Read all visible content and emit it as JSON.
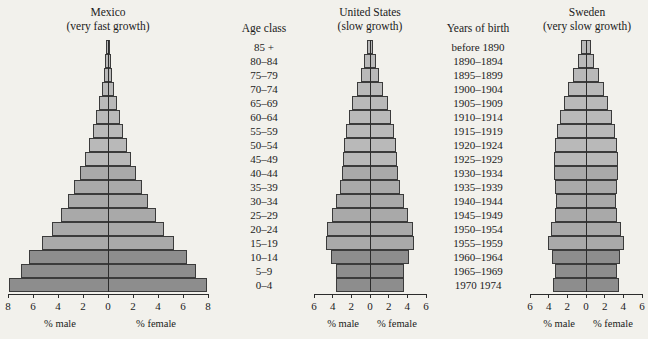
{
  "figure": {
    "background": "#f2f1ec",
    "band_colors": {
      "light": "#b9b9b9",
      "mid": "#a9a9a9",
      "dark": "#8d8d8d"
    },
    "axis_color": "#2c2c2c"
  },
  "columns": {
    "age_class": {
      "header": "Age class",
      "items": [
        "85 +",
        "80–84",
        "75–79",
        "70–74",
        "65–69",
        "60–64",
        "55–59",
        "50–54",
        "45–49",
        "40–44",
        "35–39",
        "30–34",
        "25–29",
        "20–24",
        "15–19",
        "10–14",
        "5–9",
        "0–4"
      ]
    },
    "years_of_birth": {
      "header": "Years of birth",
      "items": [
        "before 1890",
        "1890–1894",
        "1895–1899",
        "1900–1904",
        "1905–1909",
        "1910–1914",
        "1915–1919",
        "1920–1924",
        "1925–1929",
        "1930–1934",
        "1935–1939",
        "1940–1944",
        "1945–1949",
        "1950–1954",
        "1955–1959",
        "1960–1964",
        "1965–1969",
        "1970  1974"
      ]
    }
  },
  "axis_captions": {
    "male": "% male",
    "female": "% female"
  },
  "chart_data": [
    {
      "type": "bar",
      "orientation": "population-pyramid",
      "title": "Mexico",
      "subtitle": "(very fast growth)",
      "xlabel": "",
      "ylabel": "Age class",
      "xlim": [
        -8,
        8
      ],
      "xticks": [
        8,
        6,
        4,
        2,
        0,
        2,
        4,
        6,
        8
      ],
      "grid": false,
      "legend": "none",
      "categories": [
        "85 +",
        "80–84",
        "75–79",
        "70–74",
        "65–69",
        "60–64",
        "55–59",
        "50–54",
        "45–49",
        "40–44",
        "35–39",
        "30–34",
        "25–29",
        "20–24",
        "15–19",
        "10–14",
        "5–9",
        "0–4"
      ],
      "series": [
        {
          "name": "% male",
          "values": [
            0.15,
            0.25,
            0.35,
            0.5,
            0.7,
            0.95,
            1.2,
            1.5,
            1.85,
            2.25,
            2.7,
            3.2,
            3.8,
            4.5,
            5.3,
            6.3,
            7.0,
            7.9
          ]
        },
        {
          "name": "% female",
          "values": [
            0.15,
            0.25,
            0.35,
            0.5,
            0.7,
            0.95,
            1.2,
            1.5,
            1.85,
            2.25,
            2.7,
            3.2,
            3.8,
            4.5,
            5.3,
            6.3,
            7.0,
            7.9
          ]
        }
      ],
      "band_split": {
        "light_through": "45–49",
        "mid_through": "15–19",
        "dark_from": "10–14"
      }
    },
    {
      "type": "bar",
      "orientation": "population-pyramid",
      "title": "United States",
      "subtitle": "(slow growth)",
      "xlabel": "",
      "ylabel": "Age class",
      "xlim": [
        -6,
        6
      ],
      "xticks": [
        6,
        4,
        2,
        0,
        2,
        4,
        6
      ],
      "grid": false,
      "legend": "none",
      "categories": [
        "85 +",
        "80–84",
        "75–79",
        "70–74",
        "65–69",
        "60–64",
        "55–59",
        "50–54",
        "45–49",
        "40–44",
        "35–39",
        "30–34",
        "25–29",
        "20–24",
        "15–19",
        "10–14",
        "5–9",
        "0–4"
      ],
      "series": [
        {
          "name": "% male",
          "values": [
            0.3,
            0.6,
            1.0,
            1.4,
            1.9,
            2.3,
            2.6,
            2.8,
            2.9,
            3.0,
            3.2,
            3.6,
            4.1,
            4.6,
            4.7,
            4.2,
            3.6,
            3.6
          ]
        },
        {
          "name": "% female",
          "values": [
            0.3,
            0.6,
            1.0,
            1.4,
            1.9,
            2.3,
            2.6,
            2.8,
            2.9,
            3.0,
            3.2,
            3.6,
            4.1,
            4.6,
            4.7,
            4.2,
            3.6,
            3.6
          ]
        }
      ],
      "band_split": {
        "light_through": "45–49",
        "mid_through": "15–19",
        "dark_from": "10–14"
      }
    },
    {
      "type": "bar",
      "orientation": "population-pyramid",
      "title": "Sweden",
      "subtitle": "(very slow growth)",
      "xlabel": "",
      "ylabel": "Age class",
      "xlim": [
        -6,
        6
      ],
      "xticks": [
        6,
        4,
        2,
        0,
        2,
        4,
        6
      ],
      "grid": false,
      "legend": "none",
      "categories": [
        "85 +",
        "80–84",
        "75–79",
        "70–74",
        "65–69",
        "60–64",
        "55–59",
        "50–54",
        "45–49",
        "40–44",
        "35–39",
        "30–34",
        "25–29",
        "20–24",
        "15–19",
        "10–14",
        "5–9",
        "0–4"
      ],
      "series": [
        {
          "name": "% male",
          "values": [
            0.5,
            0.9,
            1.4,
            1.9,
            2.4,
            2.8,
            3.1,
            3.3,
            3.4,
            3.4,
            3.3,
            3.2,
            3.3,
            3.8,
            4.1,
            3.6,
            3.3,
            3.5
          ]
        },
        {
          "name": "% female",
          "values": [
            0.5,
            0.9,
            1.4,
            1.9,
            2.4,
            2.8,
            3.1,
            3.3,
            3.4,
            3.4,
            3.3,
            3.2,
            3.3,
            3.8,
            4.1,
            3.6,
            3.3,
            3.5
          ]
        }
      ],
      "band_split": {
        "light_through": "45–49",
        "mid_through": "15–19",
        "dark_from": "10–14"
      }
    }
  ]
}
